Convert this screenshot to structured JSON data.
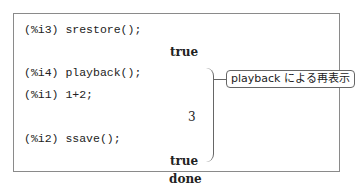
{
  "session": {
    "lines": [
      {
        "type": "input",
        "label": "(%i3)",
        "code": "srestore();",
        "text": "(%i3) srestore();"
      },
      {
        "type": "output",
        "text": "true"
      },
      {
        "type": "input",
        "label": "(%i4)",
        "code": "playback();",
        "text": "(%i4) playback();"
      },
      {
        "type": "input",
        "label": "(%i1)",
        "code": "1+2;",
        "text": "(%i1) 1+2;"
      },
      {
        "type": "output",
        "text": "3"
      },
      {
        "type": "input",
        "label": "(%i2)",
        "code": "ssave();",
        "text": "(%i2) ssave();"
      },
      {
        "type": "output",
        "text": "true"
      },
      {
        "type": "output",
        "text": "done"
      }
    ]
  },
  "annotation": {
    "label": "playback による再表示"
  }
}
